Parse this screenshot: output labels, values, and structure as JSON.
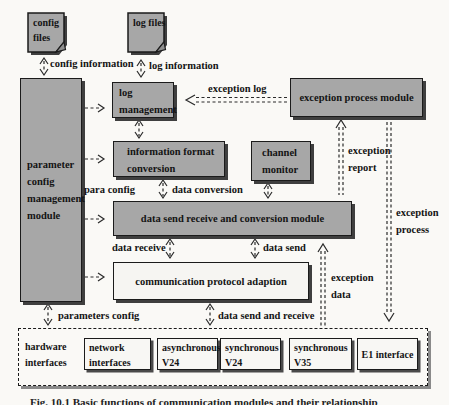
{
  "files": {
    "config": "config files",
    "log": "log files"
  },
  "modules": {
    "parameter_config_management": "parameter config management module",
    "log_management": "log management",
    "exception_process_module": "exception process module",
    "information_format_conversion": "information format conversion",
    "channel_monitor": "channel monitor",
    "data_send_receive_conversion": "data send receive and conversion module",
    "communication_protocol_adaption": "communication protocol adaption"
  },
  "hardware": {
    "group_label": "hardware interfaces",
    "items": [
      "network interfaces",
      "asynchronous V24",
      "synchronous V24",
      "synchronous V35",
      "E1 interface"
    ]
  },
  "arrow_labels": {
    "config_information": "config information",
    "log_information": "log information",
    "exception_log": "exception log",
    "para_config": "para config",
    "data_conversion": "data conversion",
    "exception_report": "exception report",
    "exception_process": "exception process",
    "exception_data": "exception data",
    "data_receive": "data receive",
    "data_send": "data send",
    "parameters_config": "parameters config",
    "data_send_and_receive": "data send and receive"
  },
  "caption": "Fig. 10.1 Basic functions of communication modules and their relationship",
  "colors": {
    "box_fill": "#a7a7a7",
    "box_border": "#1b1b1b",
    "box_shadow": "#3f3f3f",
    "background": "#faf9f6",
    "arrow": "#2a2a2a"
  }
}
